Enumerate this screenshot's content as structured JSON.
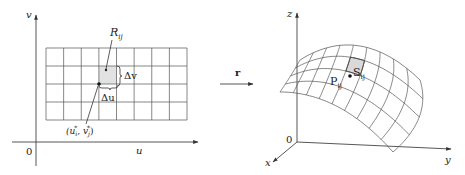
{
  "left_panel": {
    "axes": {
      "vertical_label": "v",
      "horizontal_label": "u",
      "origin_label": "0"
    },
    "grid": {
      "x0": 46,
      "x1": 187,
      "y0": 48,
      "y1": 120,
      "cols": 8,
      "rows": 4
    },
    "highlighted_cell": {
      "col": 3,
      "row": 1,
      "fill": "#e2e2e2"
    },
    "labels": {
      "region": "R",
      "region_sub": "ij",
      "delta_v": "Δv",
      "delta_u": "Δu",
      "sample_point": "(u",
      "sample_point_sub_i": "i",
      "sample_point_mid": ", v",
      "sample_point_sub_j": "j",
      "sample_point_sup": "*",
      "sample_point_end": ")"
    }
  },
  "mapping": {
    "label": "r"
  },
  "right_panel": {
    "axes": {
      "z_label": "z",
      "x_label": "x",
      "y_label": "y",
      "origin_label": "0"
    },
    "surface": {
      "u_divisions": 9,
      "v_divisions": 4,
      "highlighted_patch": {
        "u": 4,
        "v": 1,
        "fill": "#d9d9d9"
      }
    },
    "labels": {
      "point": "P",
      "point_sub": "ij",
      "patch": "S",
      "patch_sub": "ij"
    }
  }
}
